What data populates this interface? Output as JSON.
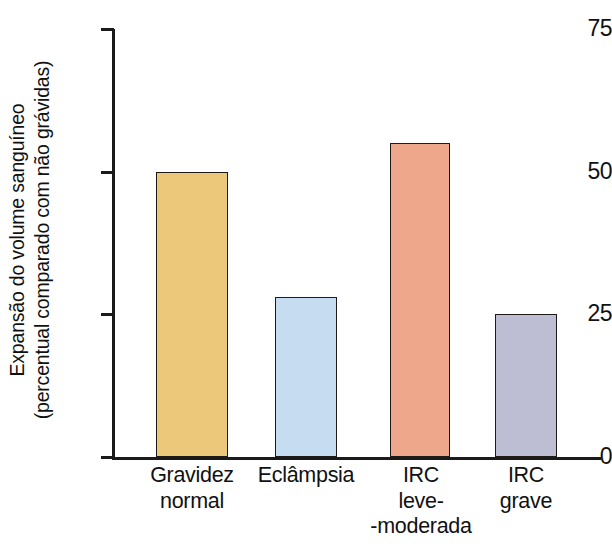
{
  "chart_data": {
    "type": "bar",
    "title": "",
    "xlabel": "",
    "ylabel_line1": "Expansão do volume sanguíneo",
    "ylabel_line2": "(percentual comparado com não grávidas)",
    "ylim": [
      0,
      75
    ],
    "yticks": [
      "0",
      "25",
      "50",
      "75"
    ],
    "ytick_values": [
      0,
      25,
      50,
      75
    ],
    "grid": false,
    "legend": "none",
    "categories": [
      "Gravidez normal",
      "Eclâmpsia",
      "IRC leve- -moderada",
      "IRC grave"
    ],
    "category_lines": [
      [
        "Gravidez",
        "normal"
      ],
      [
        "Eclâmpsia"
      ],
      [
        "IRC",
        "leve-",
        "-moderada"
      ],
      [
        "IRC",
        "grave"
      ]
    ],
    "values": [
      50,
      28,
      55,
      25
    ],
    "bar_colors": [
      "#ebc87a",
      "#c6dcf0",
      "#eea78a",
      "#bdbdd4"
    ],
    "bar_border_color": "#1d1a18",
    "axis_color": "#1a1a1a",
    "background": "#ffffff"
  }
}
